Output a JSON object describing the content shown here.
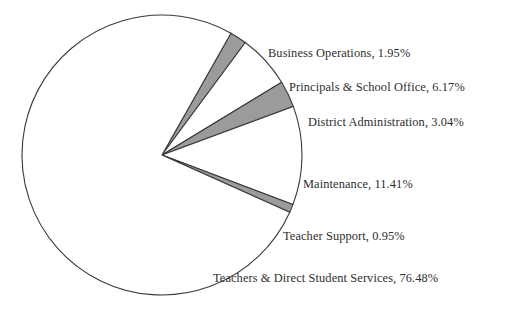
{
  "chart_data": {
    "type": "pie",
    "title": "",
    "subtitle": "",
    "xlabel": "",
    "ylabel": "",
    "legend_position": "none",
    "grid": false,
    "label_format": "{name}, {value}%",
    "total_percent": 100.0,
    "categories": [
      "Business Operations",
      "Principals & School Office",
      "District Administration",
      "Maintenance",
      "Teacher Support",
      "Teachers & Direct Student Services"
    ],
    "values": [
      1.95,
      6.17,
      3.04,
      11.41,
      0.95,
      76.48
    ],
    "slices": [
      {
        "name": "Business Operations",
        "value": 1.95,
        "label": "Business Operations, 1.95%",
        "fill": "#9b9b9b",
        "fill_name": "gray",
        "start_angle": -60.5,
        "end_angle": -53.48
      },
      {
        "name": "Principals & School Office",
        "value": 6.17,
        "label": "Principals & School Office, 6.17%",
        "fill": "#ffffff",
        "fill_name": "white",
        "start_angle": -53.48,
        "end_angle": -31.27
      },
      {
        "name": "District Administration",
        "value": 3.04,
        "label": "District Administration, 3.04%",
        "fill": "#9b9b9b",
        "fill_name": "gray",
        "start_angle": -31.27,
        "end_angle": -20.33
      },
      {
        "name": "Maintenance",
        "value": 11.41,
        "label": "Maintenance, 11.41%",
        "fill": "#ffffff",
        "fill_name": "white",
        "start_angle": -20.33,
        "end_angle": 20.75
      },
      {
        "name": "Teacher Support",
        "value": 0.95,
        "label": "Teacher Support, 0.95%",
        "fill": "#9b9b9b",
        "fill_name": "gray",
        "start_angle": 20.75,
        "end_angle": 24.17
      },
      {
        "name": "Teachers & Direct Student Services",
        "value": 76.48,
        "label": "Teachers & Direct Student Services, 76.48%",
        "fill": "#ffffff",
        "fill_name": "white",
        "start_angle": 24.17,
        "end_angle": 299.5
      }
    ],
    "geometry": {
      "center_x": 162,
      "center_y": 155,
      "radius": 140,
      "outline_color": "#3a3a3a"
    }
  }
}
